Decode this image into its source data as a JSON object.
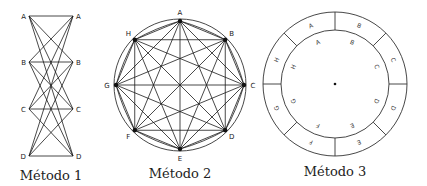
{
  "figures": [
    {
      "id": "method1",
      "caption": "Método 1",
      "type": "bipartite-complete",
      "left_labels": [
        "A",
        "B",
        "C",
        "D"
      ],
      "right_labels": [
        "A",
        "B",
        "C",
        "D"
      ]
    },
    {
      "id": "method2",
      "caption": "Método 2",
      "type": "circle-complete-graph",
      "node_labels": [
        "A",
        "B",
        "C",
        "D",
        "E",
        "F",
        "G",
        "H"
      ]
    },
    {
      "id": "method3",
      "caption": "Método 3",
      "type": "concentric-rings",
      "outer_labels": [
        "A",
        "B",
        "C",
        "D",
        "E",
        "F",
        "G",
        "H"
      ],
      "inner_labels": [
        "A",
        "B",
        "C",
        "D",
        "E",
        "F",
        "G",
        "H"
      ]
    }
  ],
  "colors": {
    "line": "#1a1a1a",
    "background": "#ffffff"
  }
}
